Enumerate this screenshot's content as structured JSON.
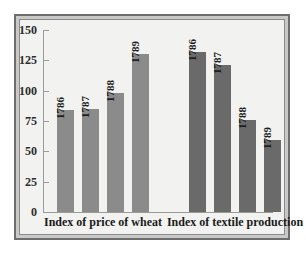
{
  "chart_data": {
    "type": "bar",
    "title": "",
    "subtitle": "",
    "xlabel": "",
    "ylabel": "",
    "ylim": [
      0,
      150
    ],
    "yticks": [
      0,
      25,
      50,
      75,
      100,
      125,
      150
    ],
    "ytick_labels": [
      "0",
      "25",
      "50",
      "75",
      "100",
      "125",
      "150"
    ],
    "grid": false,
    "legend": "none",
    "categories": [
      "Index of price of wheat",
      "Index of textile production"
    ],
    "groups": [
      {
        "name": "Index of price of wheat",
        "color": "#8b8b8b",
        "bars": [
          {
            "label": "1786",
            "value": 84
          },
          {
            "label": "1787",
            "value": 85
          },
          {
            "label": "1788",
            "value": 98
          },
          {
            "label": "1789",
            "value": 130
          }
        ]
      },
      {
        "name": "Index of textile production",
        "color": "#6a6a6a",
        "bars": [
          {
            "label": "1786",
            "value": 132
          },
          {
            "label": "1787",
            "value": 121
          },
          {
            "label": "1788",
            "value": 76
          },
          {
            "label": "1789",
            "value": 59
          }
        ]
      }
    ]
  },
  "style": {
    "frame_border_color": "#6e6e6e",
    "panel_background": "#f2f2f0",
    "axis_color": "#9a9a9a",
    "text_color": "#1f1f1f"
  }
}
